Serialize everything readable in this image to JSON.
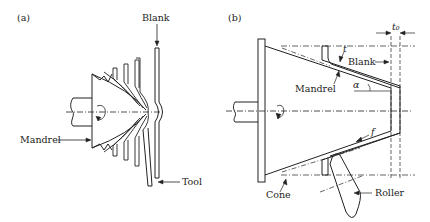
{
  "panel_a": {
    "tag": "(a)",
    "labels": {
      "blank": "Blank",
      "mandrel": "Mandrel",
      "tool": "Tool"
    }
  },
  "panel_b": {
    "tag": "(b)",
    "labels": {
      "blank": "Blank",
      "mandrel": "Mandrel",
      "cone": "Cone",
      "roller": "Roller",
      "t0": "t₀",
      "t": "t",
      "alpha": "α",
      "f": "f"
    }
  },
  "colors": {
    "line": "#222222",
    "background": "#ffffff"
  }
}
